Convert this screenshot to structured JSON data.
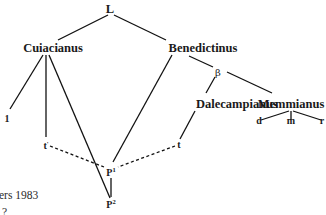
{
  "diagram": {
    "type": "stemma codicum",
    "nodes": {
      "root": {
        "label": "L"
      },
      "cuiacianus": {
        "label": "Cuiacianus"
      },
      "benedictinus": {
        "label": "Benedictinus"
      },
      "beta": {
        "label": "β"
      },
      "dalecampianus": {
        "label": "Dalecampianus"
      },
      "memmianus": {
        "label": "Memmianus"
      },
      "one": {
        "label": "1"
      },
      "t_prime": {
        "label": "t",
        "mark": "'"
      },
      "t": {
        "label": "t"
      },
      "p1": {
        "label": "P",
        "sup": "1"
      },
      "p2": {
        "label": "P",
        "sup": "2"
      },
      "d": {
        "label": "d"
      },
      "m": {
        "label": "m"
      },
      "r": {
        "label": "r"
      }
    },
    "edges": [
      {
        "from": "L",
        "to": "Cuiacianus",
        "style": "solid"
      },
      {
        "from": "L",
        "to": "Benedictinus",
        "style": "solid"
      },
      {
        "from": "Cuiacianus",
        "to": "1",
        "style": "solid"
      },
      {
        "from": "Cuiacianus",
        "to": "t'",
        "style": "solid"
      },
      {
        "from": "Cuiacianus",
        "to": "P2",
        "style": "solid"
      },
      {
        "from": "Benedictinus",
        "to": "P1",
        "style": "solid"
      },
      {
        "from": "Benedictinus",
        "to": "β",
        "style": "solid"
      },
      {
        "from": "β",
        "to": "Dalecampianus",
        "style": "solid"
      },
      {
        "from": "β",
        "to": "Memmianus",
        "style": "solid"
      },
      {
        "from": "Dalecampianus",
        "to": "t",
        "style": "solid"
      },
      {
        "from": "Memmianus",
        "to": "d",
        "style": "solid"
      },
      {
        "from": "Memmianus",
        "to": "m",
        "style": "solid"
      },
      {
        "from": "Memmianus",
        "to": "r",
        "style": "solid"
      },
      {
        "from": "P1",
        "to": "P2",
        "style": "solid"
      },
      {
        "from": "t'",
        "to": "P1",
        "style": "dashed"
      },
      {
        "from": "t",
        "to": "P1",
        "style": "dashed"
      }
    ]
  },
  "caption": {
    "text": "ers 1983"
  }
}
